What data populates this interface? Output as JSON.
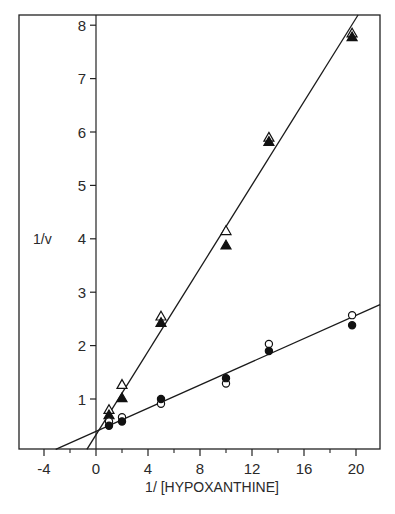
{
  "chart_data": {
    "type": "scatter",
    "title": "",
    "xlabel": "1/ [HYPOXANTHINE]",
    "ylabel": "1/v",
    "xlim": [
      -6,
      22
    ],
    "ylim": [
      0,
      8.5
    ],
    "x_ticks": [
      -4,
      0,
      4,
      8,
      12,
      16,
      20
    ],
    "x_minor_ticks": [
      -6,
      -2,
      2,
      6,
      10,
      14,
      18
    ],
    "y_ticks": [
      1,
      2,
      3,
      4,
      5,
      6,
      7,
      8
    ],
    "grid": false,
    "legend": "none",
    "series": [
      {
        "name": "open triangles",
        "marker": "triangle-open",
        "x": [
          1,
          2,
          5,
          10,
          13.3,
          19.7
        ],
        "y": [
          0.8,
          1.27,
          2.55,
          4.15,
          5.9,
          7.85
        ]
      },
      {
        "name": "filled triangles",
        "marker": "triangle-filled",
        "x": [
          1,
          2,
          5,
          10,
          13.3,
          19.7
        ],
        "y": [
          0.7,
          1.02,
          2.43,
          3.88,
          5.82,
          7.78
        ]
      },
      {
        "name": "open circles",
        "marker": "circle-open",
        "x": [
          1,
          2,
          5,
          10,
          13.3,
          19.7
        ],
        "y": [
          0.58,
          0.66,
          0.91,
          1.29,
          2.03,
          2.57
        ]
      },
      {
        "name": "filled circles",
        "marker": "circle-filled",
        "x": [
          1,
          2,
          5,
          10,
          13.3,
          19.7
        ],
        "y": [
          0.5,
          0.58,
          1.0,
          1.39,
          1.9,
          2.38
        ]
      }
    ],
    "fit_lines": [
      {
        "name": "triangles fit",
        "x_intercept": -0.7,
        "y_intercept": 0.43,
        "slope": 0.385
      },
      {
        "name": "circles fit",
        "x_intercept": -3.1,
        "y_intercept": 0.43,
        "slope": 0.107
      }
    ]
  },
  "labels": {
    "xlabel": "1/ [HYPOXANTHINE]",
    "ylabel": "1/v"
  }
}
